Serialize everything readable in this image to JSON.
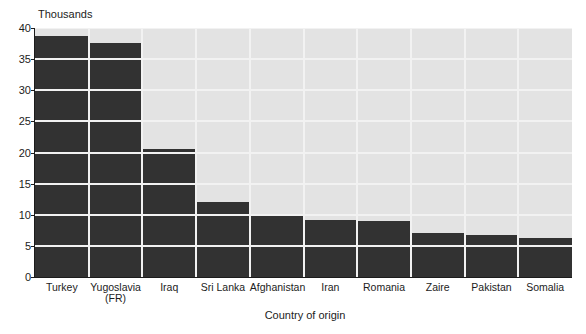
{
  "chart_data": {
    "type": "bar",
    "title": "",
    "xlabel": "Country of origin",
    "ylabel": "",
    "unit_label": "Thousands",
    "categories": [
      "Turkey",
      "Yugoslavia (FR)",
      "Iraq",
      "Sri Lanka",
      "Afghanistan",
      "Iran",
      "Romania",
      "Zaire",
      "Pakistan",
      "Somalia"
    ],
    "category_lines": [
      [
        "Turkey"
      ],
      [
        "Yugoslavia",
        "(FR)"
      ],
      [
        "Iraq"
      ],
      [
        "Sri Lanka"
      ],
      [
        "Afghanistan"
      ],
      [
        "Iran"
      ],
      [
        "Romania"
      ],
      [
        "Zaire"
      ],
      [
        "Pakistan"
      ],
      [
        "Somalia"
      ]
    ],
    "values": [
      38.7,
      37.6,
      20.6,
      12.0,
      10.2,
      9.2,
      9.0,
      7.1,
      6.8,
      6.3
    ],
    "ylim": [
      0,
      40
    ],
    "yticks": [
      0,
      5,
      10,
      15,
      20,
      25,
      30,
      35,
      40
    ],
    "ytick_labels": [
      "0",
      "5",
      "10",
      "15",
      "20",
      "25",
      "30",
      "35",
      "40"
    ],
    "grid": true,
    "grid_orientation": "both",
    "legend": false,
    "legend_position": "none",
    "colors": {
      "bar": "#323232",
      "plot_background": "#e3e3e3",
      "gridline": "#f2f2f2",
      "axis": "#1c1c1c",
      "page_background": "#ffffff",
      "text": "#1c1c1c"
    }
  }
}
